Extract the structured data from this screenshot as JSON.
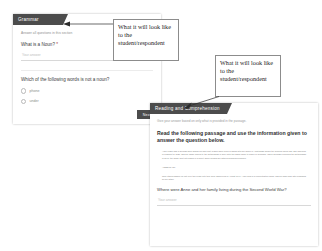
{
  "grammar": {
    "section_title": "Grammar",
    "section_note": "Answer all questions in this section",
    "q1": {
      "label": "What is a Noun?",
      "required_mark": " *",
      "answer_placeholder": "Your answer"
    },
    "q2": {
      "label": "Which of the following words is not a noun?",
      "options": [
        {
          "label": "phone"
        },
        {
          "label": "under"
        }
      ]
    },
    "next_button": "Next"
  },
  "reading": {
    "section_title": "Reading and Comprehension",
    "section_note": "Give your answer based on only what is provided in the passage.",
    "instruction": "Read the following passage and use the information given to answer the question below.",
    "passage": {
      "para1": "Anne Frank was a German-born Jewish girl who kept a diary while living in hiding with her family in Amsterdam during the Second World War. She was born in Frankfurt in 1929, and her family moved to the Netherlands in 1934 after the Nazis came to power in Germany. When Germany occupied the Netherlands in 1940, the family went into hiding in a secret annex behind her father's business premises.",
      "heading": "ANNE FRANK",
      "para2": "They stayed hidden for just over two years until they were discovered in August 1944. Anne died in a concentration camp, and her diary was later published by her father."
    },
    "question": "Where were Anne and her family living during the Second World War?",
    "answer_placeholder": "Your answer"
  },
  "callouts": [
    {
      "text": "What it will look like to the student/respondent"
    },
    {
      "text": "What it will look like to the student/respondent"
    }
  ]
}
